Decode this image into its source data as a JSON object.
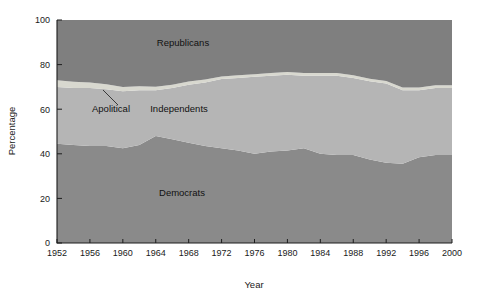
{
  "chart_data": {
    "type": "area",
    "stacked": true,
    "title": "",
    "xlabel": "Year",
    "ylabel": "Percentage",
    "xlim": [
      1952,
      2000
    ],
    "ylim": [
      0,
      100
    ],
    "grid": false,
    "legend_position": "inline-labels",
    "x_tick_labels": [
      "1952",
      "1956",
      "1960",
      "1964",
      "1968",
      "1972",
      "1976",
      "1980",
      "1984",
      "1988",
      "1992",
      "1996",
      "2000"
    ],
    "y_tick_labels": [
      "0",
      "20",
      "40",
      "60",
      "80",
      "100"
    ],
    "x_ticks": [
      1952,
      1956,
      1960,
      1964,
      1968,
      1972,
      1976,
      1980,
      1984,
      1988,
      1992,
      1996,
      2000
    ],
    "y_ticks": [
      0,
      20,
      40,
      60,
      80,
      100
    ],
    "x": [
      1952,
      1954,
      1956,
      1958,
      1960,
      1962,
      1964,
      1966,
      1968,
      1970,
      1972,
      1974,
      1976,
      1978,
      1980,
      1982,
      1984,
      1986,
      1988,
      1990,
      1992,
      1994,
      1996,
      1998,
      2000
    ],
    "series": [
      {
        "name": "Democrats",
        "color": "#8a8a8a",
        "values": [
          44.5,
          44.0,
          43.5,
          43.5,
          42.5,
          44.0,
          48.0,
          46.5,
          45.0,
          43.5,
          42.5,
          41.5,
          40.0,
          41.0,
          41.5,
          42.5,
          40.0,
          39.5,
          39.5,
          37.5,
          36.0,
          35.5,
          38.5,
          39.5,
          39.5
        ]
      },
      {
        "name": "Independents",
        "color": "#b5b5b5",
        "values": [
          25.5,
          25.5,
          26.0,
          25.5,
          25.5,
          24.5,
          20.5,
          23.0,
          26.0,
          28.5,
          31.0,
          32.5,
          34.5,
          34.0,
          34.0,
          32.5,
          35.0,
          35.5,
          34.5,
          35.0,
          35.5,
          33.0,
          30.0,
          30.0,
          30.0
        ]
      },
      {
        "name": "Apolitical",
        "color": "#d8d8cf",
        "values": [
          3.0,
          2.8,
          2.5,
          2.2,
          2.0,
          1.8,
          1.6,
          1.5,
          1.4,
          1.3,
          1.2,
          1.2,
          1.2,
          1.2,
          1.2,
          1.2,
          1.2,
          1.2,
          1.2,
          1.2,
          1.2,
          1.2,
          1.2,
          1.2,
          1.2
        ]
      },
      {
        "name": "Republicans",
        "color": "#7f7f7f",
        "values": [
          27.0,
          27.7,
          28.0,
          28.8,
          30.0,
          29.7,
          29.9,
          29.0,
          27.6,
          26.7,
          25.3,
          24.8,
          24.3,
          23.8,
          23.3,
          23.8,
          23.8,
          23.8,
          24.8,
          26.3,
          27.3,
          30.3,
          30.3,
          29.3,
          29.3
        ]
      }
    ],
    "annotations": [
      {
        "text": "Republicans",
        "x_px": 183,
        "y_px": 46
      },
      {
        "text": "Apolitical",
        "x_px": 111,
        "y_px": 112
      },
      {
        "text": "Independents",
        "x_px": 179,
        "y_px": 112
      },
      {
        "text": "Democrats",
        "x_px": 182,
        "y_px": 196
      }
    ]
  },
  "axes": {
    "x_axis_title": "Year",
    "y_axis_title": "Percentage"
  },
  "colors": {
    "democrats": "#8a8a8a",
    "independents": "#b5b5b5",
    "apolitical": "#d8d8cf",
    "republicans": "#7f7f7f",
    "axis": "#1d1d1d",
    "text": "#1a1a1a",
    "background": "#ffffff"
  }
}
